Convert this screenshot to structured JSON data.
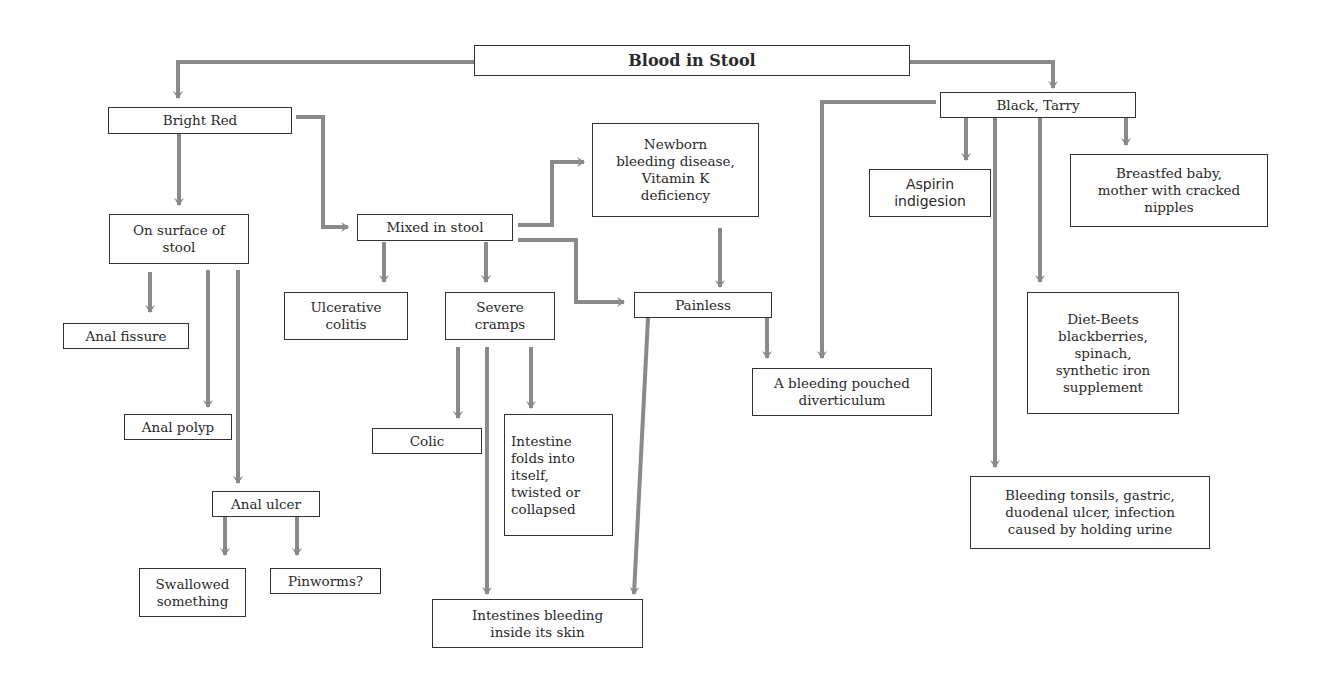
{
  "diagram": {
    "title": "Blood in Stool",
    "line_color": "#8a8a8a",
    "box_border_color": "#333333",
    "nodes": {
      "root": "Blood in Stool",
      "bright_red": "Bright Red",
      "black_tarry": "Black, Tarry",
      "on_surface": "On surface of\nstool",
      "mixed": "Mixed in stool",
      "newborn": "Newborn\nbleeding disease,\nVitamin K\ndeficiency",
      "aspirin": "Aspirin\nindigesion",
      "breastfed": "Breastfed baby,\nmother with cracked\nnipples",
      "anal_fissure": "Anal fissure",
      "ulcerative": "Ulcerative\ncolitis",
      "severe_cramps": "Severe\ncramps",
      "painless": "Painless",
      "diet_beets": "Diet-Beets\nblackberries,\nspinach,\nsynthetic iron\nsupplement",
      "bleeding_pouch": "A bleeding pouched\ndiverticulum",
      "anal_polyp": "Anal polyp",
      "colic": "Colic",
      "intestine_folds": "Intestine\nfolds into\nitself,\ntwisted or\ncollapsed",
      "anal_ulcer": "Anal ulcer",
      "bleeding_tonsils": "Bleeding tonsils, gastric,\nduodenal ulcer, infection\ncaused by holding urine",
      "swallowed": "Swallowed\nsomething",
      "pinworms": "Pinworms?",
      "intestines_bleeding": "Intestines bleeding\ninside its skin"
    }
  }
}
